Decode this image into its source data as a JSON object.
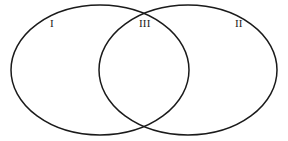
{
  "figure": {
    "kind": "venn-diagram",
    "width": 288,
    "height": 141,
    "background_color": "#ffffff",
    "stroke_color": "#1a1a1a",
    "stroke_width": 1.5
  },
  "chart_data": {
    "type": "diagram",
    "subtype": "venn",
    "title": "",
    "set_count": 2,
    "fill": "none",
    "grid": false,
    "legend": false,
    "shapes": [
      {
        "name": "left-set",
        "shape": "ellipse",
        "cx": 100,
        "cy": 70,
        "rx": 89,
        "ry": 65,
        "label": "I"
      },
      {
        "name": "right-set",
        "shape": "ellipse",
        "cx": 188,
        "cy": 70,
        "rx": 89,
        "ry": 65,
        "label": "II"
      }
    ],
    "regions": [
      {
        "id": "I",
        "label": "I",
        "description": "left set only",
        "label_x": 53,
        "label_y": 24
      },
      {
        "id": "III",
        "label": "III",
        "description": "intersection",
        "label_x": 145,
        "label_y": 23
      },
      {
        "id": "II",
        "label": "II",
        "description": "right set only",
        "label_x": 239,
        "label_y": 24
      }
    ],
    "labels": [
      "I",
      "III",
      "II"
    ]
  },
  "labels": {
    "region_one": "I",
    "region_three": "III",
    "region_two": "II"
  }
}
